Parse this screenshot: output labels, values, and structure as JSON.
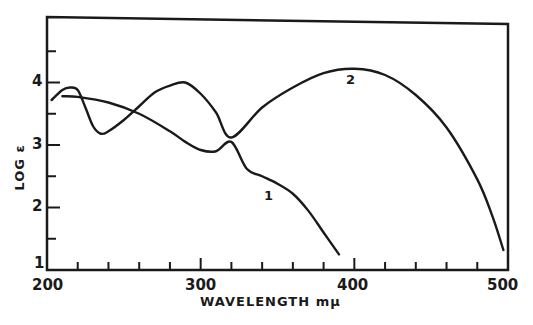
{
  "chart_data": {
    "type": "line",
    "title": "",
    "xlabel": "WAVELENGTH mμ",
    "ylabel": "LOG ε",
    "xlim": [
      200,
      500
    ],
    "ylim": [
      1,
      5
    ],
    "grid": false,
    "legend": "inline curve labels",
    "x_ticks_major": [
      200,
      300,
      400,
      500
    ],
    "x_tick_labels": [
      "200",
      "300",
      "400",
      "500"
    ],
    "x_ticks_minor_step": 20,
    "y_ticks_major": [
      1,
      2,
      3,
      4
    ],
    "y_tick_labels": [
      "1",
      "2",
      "3",
      "4"
    ],
    "y_ticks_minor_step": 0.5,
    "series": [
      {
        "name": "1",
        "x": [
          210,
          220,
          240,
          260,
          280,
          290,
          300,
          310,
          320,
          330,
          340,
          350,
          360,
          370,
          380,
          390
        ],
        "y": [
          3.78,
          3.77,
          3.68,
          3.5,
          3.22,
          3.05,
          2.92,
          2.9,
          3.05,
          2.62,
          2.5,
          2.38,
          2.22,
          1.95,
          1.6,
          1.25
        ]
      },
      {
        "name": "2",
        "x": [
          203,
          210,
          215,
          220,
          225,
          230,
          235,
          240,
          250,
          260,
          270,
          280,
          290,
          300,
          310,
          320,
          340,
          360,
          380,
          400,
          420,
          440,
          460,
          480,
          490,
          497
        ],
        "y": [
          3.72,
          3.88,
          3.92,
          3.88,
          3.6,
          3.3,
          3.18,
          3.22,
          3.4,
          3.62,
          3.84,
          3.95,
          4.0,
          3.82,
          3.52,
          3.12,
          3.6,
          3.92,
          4.15,
          4.22,
          4.12,
          3.8,
          3.28,
          2.45,
          1.85,
          1.32
        ]
      }
    ],
    "annotations": [
      {
        "text": "1",
        "x": 343,
        "y": 2.23
      },
      {
        "text": "2",
        "x": 398,
        "y": 4.0
      }
    ]
  },
  "labels": {
    "x_ticks": [
      "200",
      "300",
      "400",
      "500"
    ],
    "y_ticks": [
      "1",
      "2",
      "3",
      "4"
    ],
    "xlabel": "WAVELENGTH mμ",
    "ylabel": "LOG ε",
    "curve1": "1",
    "curve2": "2"
  }
}
